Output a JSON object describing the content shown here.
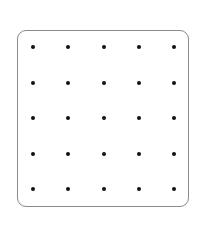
{
  "diagram": {
    "type": "dot-grid",
    "rows": 5,
    "cols": 5,
    "dot_color": "#111111",
    "border_color": "#8a8a8a",
    "background": "#ffffff",
    "dot_x_positions": [
      33,
      68,
      104,
      139,
      174
    ],
    "dot_y_positions": [
      47,
      83,
      118,
      154,
      189
    ]
  }
}
